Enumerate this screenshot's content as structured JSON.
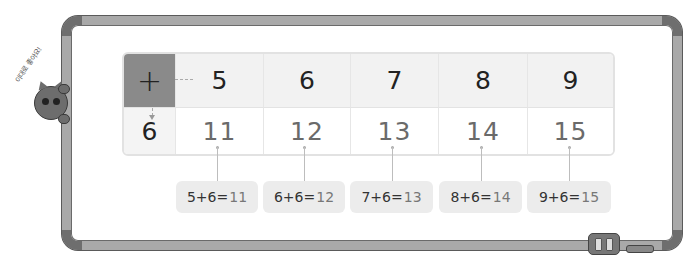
{
  "speech_bubble": "이대로 좋아요!",
  "table": {
    "operator": "+",
    "header_values": [
      "5",
      "6",
      "7",
      "8",
      "9"
    ],
    "row_label": "6",
    "results": [
      "11",
      "12",
      "13",
      "14",
      "15"
    ]
  },
  "equations": [
    {
      "lhs": "5+6=",
      "result": "11"
    },
    {
      "lhs": "6+6=",
      "result": "12"
    },
    {
      "lhs": "7+6=",
      "result": "13"
    },
    {
      "lhs": "8+6=",
      "result": "14"
    },
    {
      "lhs": "9+6=",
      "result": "15"
    }
  ],
  "colors": {
    "frame": "#a9a9a9",
    "frame_corner": "#6e6e6e",
    "operator_cell": "#8a8a8a",
    "header_bg": "#f2f2f2",
    "equation_bg": "#ececec"
  }
}
